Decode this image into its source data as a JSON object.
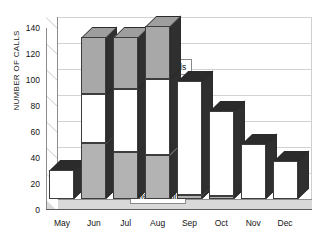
{
  "chart_data": {
    "type": "bar",
    "subtype": "stacked-3d-column",
    "title": "",
    "xlabel": "",
    "ylabel": "NUMBER OF CALLS",
    "categories": [
      "May",
      "Jun",
      "Jul",
      "Aug",
      "Sep",
      "Oct",
      "Nov",
      "Dec"
    ],
    "ylim": [
      0,
      140
    ],
    "yticks": [
      0,
      20,
      40,
      60,
      80,
      100,
      120,
      140
    ],
    "ytick_labels": [
      "0",
      "20",
      "40",
      "60",
      "80",
      "100",
      "120",
      "140"
    ],
    "grid": true,
    "legend_position": "inline-callouts",
    "series": [
      {
        "name": "Media Calls",
        "color": "#b3b3b3",
        "values": [
          0,
          43,
          36,
          34,
          3,
          2,
          0,
          0
        ]
      },
      {
        "name": "Public Calls",
        "color": "#ffffff",
        "values": [
          22,
          38,
          49,
          58,
          88,
          66,
          42,
          29
        ]
      },
      {
        "name": "Total Calls",
        "color": "#a8a8a8",
        "values": [
          0,
          44,
          40,
          41,
          0,
          0,
          0,
          0
        ]
      }
    ],
    "stack_totals": [
      22,
      125,
      125,
      133,
      91,
      68,
      42,
      29
    ],
    "annotations": [
      {
        "text": "Total Calls",
        "series": "Total Calls"
      },
      {
        "text": "Public Calls",
        "series": "Public Calls"
      },
      {
        "text": "Media Calls",
        "series": "Media Calls"
      }
    ]
  },
  "axis": {
    "y_title": "NUMBER OF CALLS",
    "y_ticks": [
      "140",
      "120",
      "100",
      "80",
      "60",
      "40",
      "20",
      "0"
    ],
    "x_ticks": [
      "May",
      "Jun",
      "Jul",
      "Aug",
      "Sep",
      "Oct",
      "Nov",
      "Dec"
    ]
  },
  "labels": {
    "total_calls": "Total Calls",
    "public_calls": "Public Calls",
    "media_calls": "Media Calls"
  }
}
